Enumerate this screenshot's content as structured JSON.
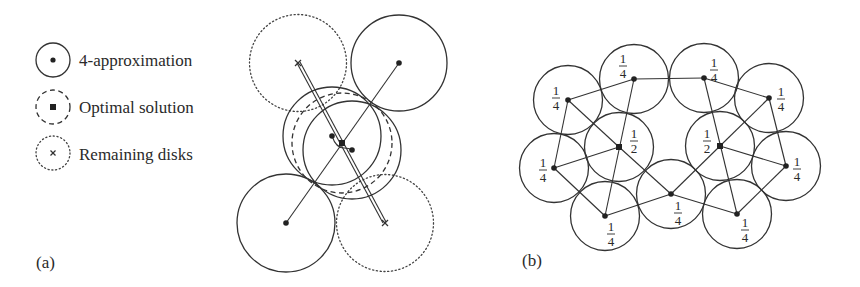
{
  "legend": {
    "items": [
      {
        "label": "4-approximation",
        "style": "solid",
        "marker": "dot",
        "cx": 53,
        "cy": 60,
        "r": 17
      },
      {
        "label": "Optimal solution",
        "style": "dashed",
        "marker": "square",
        "cx": 53,
        "cy": 107,
        "r": 17
      },
      {
        "label": "Remaining disks",
        "style": "dotted",
        "marker": "cross",
        "cx": 53,
        "cy": 153,
        "r": 17
      }
    ]
  },
  "panel_a": {
    "label": "(a)",
    "label_pos": {
      "x": 36,
      "y": 268
    },
    "disks": [
      {
        "role": "remaining",
        "style": "dotted",
        "cx": 298,
        "cy": 63,
        "r": 48.5,
        "marker": "cross"
      },
      {
        "role": "approx",
        "style": "solid",
        "cx": 399,
        "cy": 63,
        "r": 48,
        "marker": "dot"
      },
      {
        "role": "approx",
        "style": "solid",
        "cx": 286,
        "cy": 223,
        "r": 49,
        "marker": "dot"
      },
      {
        "role": "remaining",
        "style": "dotted",
        "cx": 385,
        "cy": 223,
        "r": 48.5,
        "marker": "cross"
      },
      {
        "role": "approx",
        "style": "solid",
        "cx": 332,
        "cy": 136,
        "r": 49,
        "marker": "dot"
      },
      {
        "role": "approx",
        "style": "solid",
        "cx": 352,
        "cy": 150,
        "r": 49,
        "marker": "dot"
      },
      {
        "role": "optimal",
        "style": "dashed",
        "cx": 342,
        "cy": 143,
        "r": 50,
        "marker": "square"
      }
    ],
    "edges": [
      [
        399,
        63,
        286,
        223
      ],
      [
        297,
        63,
        383,
        223
      ],
      [
        300,
        62,
        386,
        222
      ]
    ]
  },
  "panel_b": {
    "label": "(b)",
    "label_pos": {
      "x": 522,
      "y": 266
    },
    "radius": 34.5,
    "nodes": [
      {
        "id": "ul",
        "x": 568,
        "y": 100,
        "marker": "dot",
        "weight_num": "1",
        "weight_den": "4",
        "lx": 556,
        "ly": 98
      },
      {
        "id": "t1",
        "x": 634,
        "y": 79,
        "marker": "dot",
        "weight_num": "1",
        "weight_den": "4",
        "lx": 623,
        "ly": 66
      },
      {
        "id": "t2",
        "x": 704,
        "y": 78,
        "marker": "dot",
        "weight_num": "1",
        "weight_den": "4",
        "lx": 714,
        "ly": 70
      },
      {
        "id": "ur",
        "x": 769,
        "y": 98,
        "marker": "dot",
        "weight_num": "1",
        "weight_den": "4",
        "lx": 781,
        "ly": 99
      },
      {
        "id": "lm",
        "x": 554,
        "y": 168,
        "marker": "dot",
        "weight_num": "1",
        "weight_den": "4",
        "lx": 543,
        "ly": 170
      },
      {
        "id": "cl",
        "x": 619,
        "y": 147,
        "marker": "square",
        "weight_num": "1",
        "weight_den": "2",
        "lx": 634,
        "ly": 141
      },
      {
        "id": "cr",
        "x": 720,
        "y": 146,
        "marker": "square",
        "weight_num": "1",
        "weight_den": "2",
        "lx": 707,
        "ly": 141
      },
      {
        "id": "rm",
        "x": 786,
        "y": 166,
        "marker": "dot",
        "weight_num": "1",
        "weight_den": "4",
        "lx": 797,
        "ly": 169
      },
      {
        "id": "bl",
        "x": 605,
        "y": 216,
        "marker": "dot",
        "weight_num": "1",
        "weight_den": "4",
        "lx": 611,
        "ly": 234
      },
      {
        "id": "bc",
        "x": 671,
        "y": 194,
        "marker": "dot",
        "weight_num": "1",
        "weight_den": "4",
        "lx": 678,
        "ly": 213
      },
      {
        "id": "br",
        "x": 737,
        "y": 214,
        "marker": "dot",
        "weight_num": "1",
        "weight_den": "4",
        "lx": 745,
        "ly": 230
      }
    ],
    "edges": [
      [
        "ul",
        "t1"
      ],
      [
        "ul",
        "lm"
      ],
      [
        "ul",
        "cl"
      ],
      [
        "cl",
        "bc"
      ],
      [
        "t1",
        "t2"
      ],
      [
        "t1",
        "bl"
      ],
      [
        "lm",
        "cl"
      ],
      [
        "lm",
        "bl"
      ],
      [
        "bl",
        "bc"
      ],
      [
        "bc",
        "cr"
      ],
      [
        "cr",
        "ur"
      ],
      [
        "bc",
        "br"
      ],
      [
        "t2",
        "ur"
      ],
      [
        "t2",
        "br"
      ],
      [
        "cr",
        "rm"
      ],
      [
        "ur",
        "rm"
      ],
      [
        "rm",
        "br"
      ]
    ]
  },
  "colors": {
    "ink": "#333333",
    "background": "#ffffff"
  }
}
